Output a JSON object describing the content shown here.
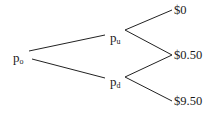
{
  "diagram": {
    "type": "binomial-tree",
    "nodes": {
      "root": {
        "base": "p",
        "sub": "o"
      },
      "up": {
        "base": "p",
        "sub": "u"
      },
      "down": {
        "base": "p",
        "sub": "d"
      }
    },
    "leaves": [
      {
        "label": "$0"
      },
      {
        "label": "$0.50"
      },
      {
        "label": "$9.50"
      }
    ],
    "edges": [
      [
        "root",
        "up"
      ],
      [
        "root",
        "down"
      ],
      [
        "up",
        "leaf0"
      ],
      [
        "up",
        "leaf1"
      ],
      [
        "down",
        "leaf1"
      ],
      [
        "down",
        "leaf2"
      ]
    ],
    "line_color": "#222222",
    "text_color": "#1a1a1a"
  }
}
